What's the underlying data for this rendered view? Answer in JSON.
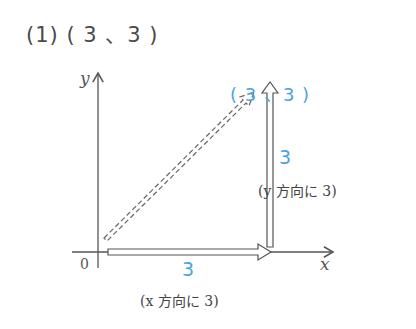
{
  "title": "(1) ( 3 、3 )",
  "point_label": "( 3 、3 )",
  "x_move": {
    "value": "3",
    "note": "(x 方向に 3)"
  },
  "y_move": {
    "value": "3",
    "note": "(y 方向に 3)"
  },
  "axes": {
    "x_label": "x",
    "y_label": "y",
    "origin_label": "0"
  },
  "colors": {
    "accent": "#4aa3df",
    "line": "#555555"
  }
}
